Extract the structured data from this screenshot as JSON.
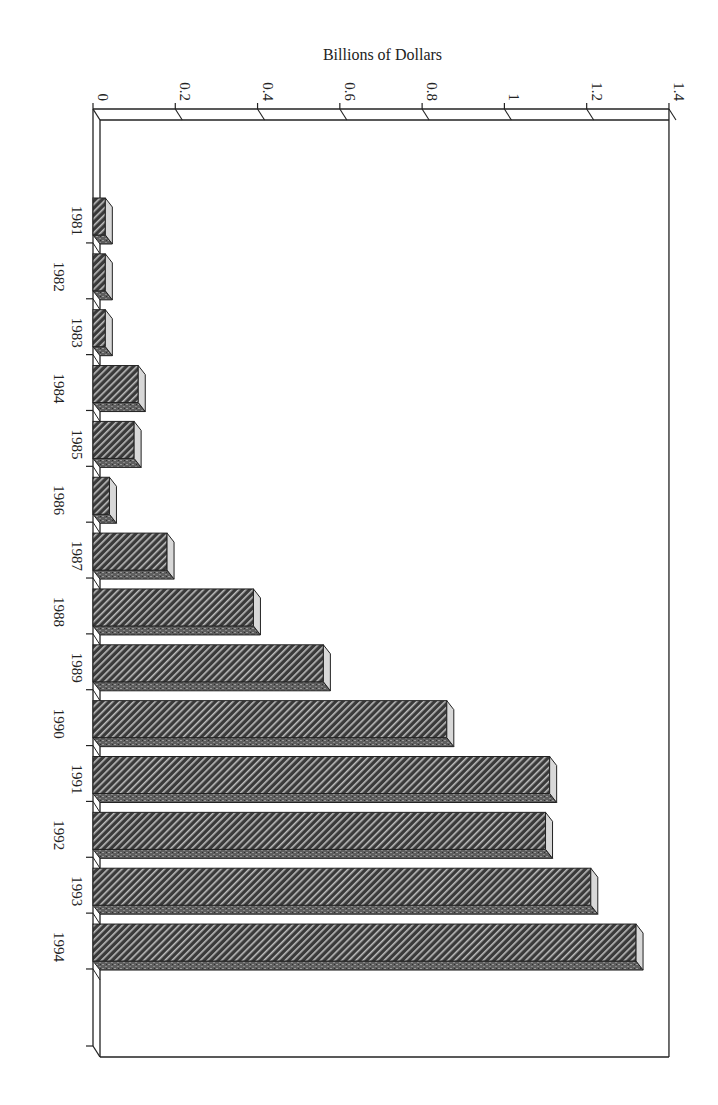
{
  "chart_data": {
    "type": "bar",
    "orientation": "horizontal-3d (page rotated 90°)",
    "title": "",
    "xlabel": "",
    "ylabel": "Billions of Dollars",
    "ylim": [
      0,
      1.4
    ],
    "value_ticks": [
      "0",
      "0.2",
      "0.4",
      "0.6",
      "0.8",
      "1",
      "1.2",
      "1.4"
    ],
    "categories": [
      "1981",
      "1982",
      "1983",
      "1984",
      "1985",
      "1986",
      "1987",
      "1988",
      "1989",
      "1990",
      "1991",
      "1992",
      "1993",
      "1994"
    ],
    "values": [
      0.03,
      0.03,
      0.03,
      0.11,
      0.1,
      0.04,
      0.18,
      0.39,
      0.56,
      0.86,
      1.11,
      1.1,
      1.21,
      1.32
    ],
    "grid": false,
    "legend": null
  },
  "colors": {
    "bar_face": "#3a3a3a",
    "bar_hatch": "#bdbdbd",
    "bar_side": "#d8d8d8",
    "bar_bottom": "#6a6a6a",
    "axis": "#222222"
  }
}
